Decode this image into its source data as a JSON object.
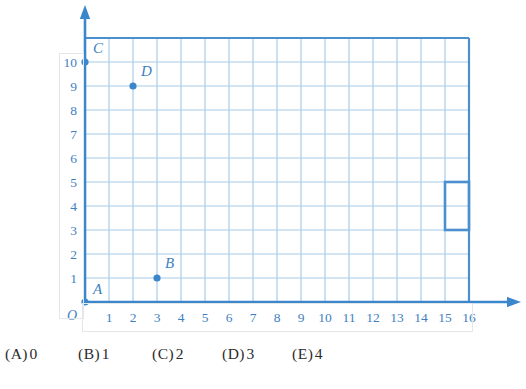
{
  "figure": {
    "type": "coordinate-grid",
    "grid": {
      "x_min": 0,
      "x_max": 16,
      "y_min": 0,
      "y_max": 11,
      "cell_px": 24,
      "origin_px": {
        "x": 85,
        "y": 302
      },
      "x_tick_labels": [
        "1",
        "2",
        "3",
        "4",
        "5",
        "6",
        "7",
        "8",
        "9",
        "10",
        "11",
        "12",
        "13",
        "14",
        "15",
        "16"
      ],
      "y_tick_labels": [
        "1",
        "2",
        "3",
        "4",
        "5",
        "6",
        "7",
        "8",
        "9",
        "10"
      ],
      "origin_label": "O",
      "grid_line_color": "#a8cbe8",
      "grid_border_color": "#4a90d0",
      "axis_color": "#3b87cc"
    },
    "points": [
      {
        "label": "A",
        "x": 0,
        "y": 0,
        "label_dx": 8,
        "label_dy": -8
      },
      {
        "label": "B",
        "x": 3,
        "y": 1,
        "label_dx": 8,
        "label_dy": -10
      },
      {
        "label": "C",
        "x": 0,
        "y": 10,
        "label_dx": 8,
        "label_dy": -9
      },
      {
        "label": "D",
        "x": 2,
        "y": 9,
        "label_dx": 8,
        "label_dy": -10
      }
    ],
    "point_color": "#3b87cc",
    "shapes": [
      {
        "name": "highlighted-rectangle",
        "type": "rect",
        "x1": 15,
        "y1": 3,
        "x2": 16,
        "y2": 5,
        "stroke": "#4a90d0",
        "stroke_width": 2.6
      }
    ]
  },
  "choices": {
    "items": [
      {
        "paren": "(A)",
        "value": "0",
        "left": 5
      },
      {
        "paren": "(B)",
        "value": "1",
        "left": 78
      },
      {
        "paren": "(C)",
        "value": "2",
        "left": 152
      },
      {
        "paren": "(D)",
        "value": "3",
        "left": 222
      },
      {
        "paren": "(E)",
        "value": "4",
        "left": 292
      }
    ]
  }
}
